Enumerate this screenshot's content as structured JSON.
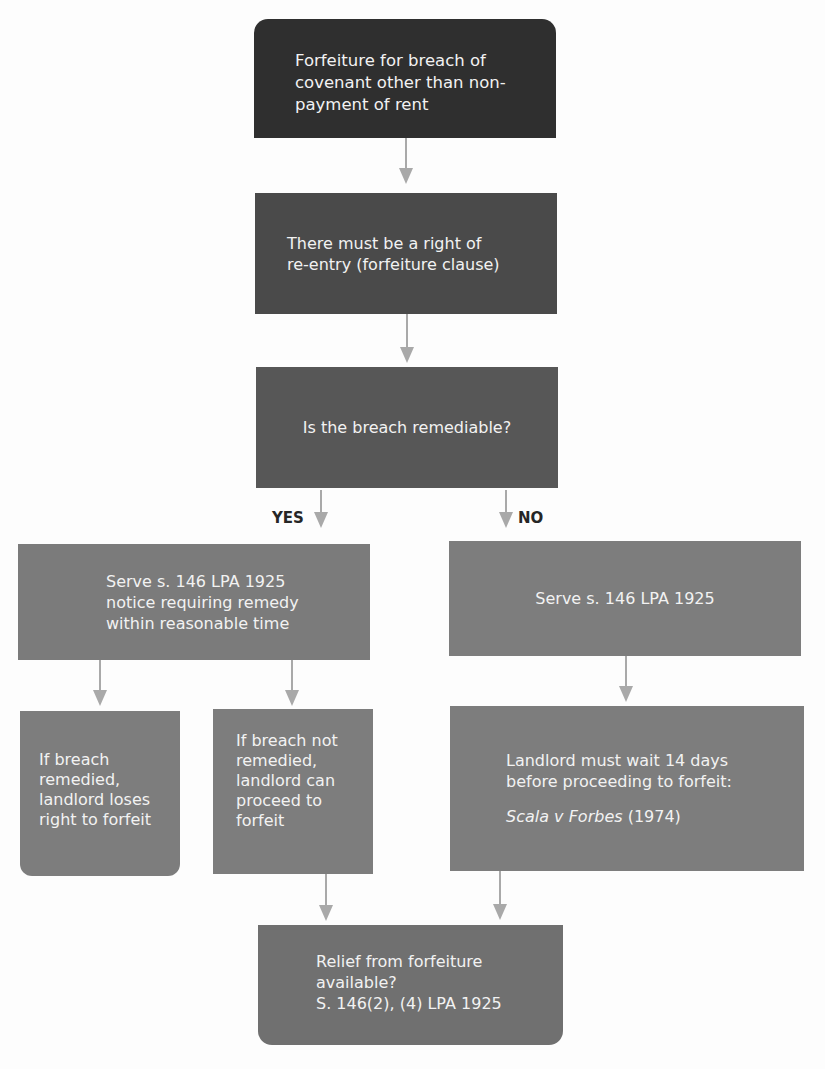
{
  "flowchart": {
    "title_box": {
      "lines": [
        "Forfeiture for breach of",
        "covenant other than non-",
        "payment of rent"
      ]
    },
    "requirement_box": {
      "lines": [
        "There must be a right of",
        "re-entry (forfeiture clause)"
      ]
    },
    "question_box": {
      "text": "Is the breach remediable?"
    },
    "branch_labels": {
      "yes": "YES",
      "no": "NO"
    },
    "yes_branch": {
      "notice_box": {
        "lines": [
          "Serve s. 146 LPA 1925",
          "notice requiring remedy",
          "within reasonable time"
        ]
      },
      "remedied_box": {
        "lines": [
          "If breach",
          "remedied,",
          "landlord loses",
          "right to forfeit"
        ]
      },
      "not_remedied_box": {
        "lines": [
          "If breach not",
          "remedied,",
          "landlord can",
          "proceed to",
          "forfeit"
        ]
      }
    },
    "no_branch": {
      "notice_box": {
        "text": "Serve s. 146 LPA 1925"
      },
      "wait_box": {
        "lines": [
          "Landlord must wait 14 days",
          "before proceeding to forfeit:"
        ],
        "case_name": "Scala v Forbes",
        "case_year": " (1974)"
      }
    },
    "relief_box": {
      "lines": [
        "Relief from forfeiture",
        "available?",
        "S. 146(2), (4) LPA 1925"
      ]
    },
    "colors": {
      "title_box": "#2f2f2f",
      "requirement_box": "#4a4a4a",
      "question_box": "#575757",
      "branch_boxes": "#7b7b7b",
      "relief_box": "#707070",
      "arrows": "#a9a9a9",
      "box_text": "#f2f2f2",
      "label_text": "#262626",
      "background": "#fdfdfd"
    }
  }
}
